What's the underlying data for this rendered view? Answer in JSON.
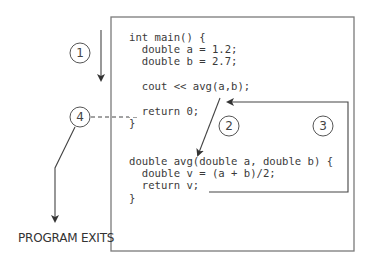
{
  "diagram": {
    "code_lines": [
      "int main() {",
      "  double a = 1.2;",
      "  double b = 2.7;",
      "",
      "  cout << avg(a,b);",
      "",
      "  return 0;",
      "}",
      "",
      "double avg(double a, double b) {",
      "  double v = (a + b)/2;",
      "  return v;",
      "}"
    ],
    "steps": [
      {
        "number": "1",
        "description": "execution proceeds down main"
      },
      {
        "number": "2",
        "description": "call to avg transfers control"
      },
      {
        "number": "3",
        "description": "return v returns to caller"
      },
      {
        "number": "4",
        "description": "return 0 ends main"
      }
    ],
    "exit_label": "PROGRAM EXITS",
    "colors": {
      "box_border": "#7a7a7a",
      "line": "#444444",
      "text": "#3a3a3a"
    }
  }
}
